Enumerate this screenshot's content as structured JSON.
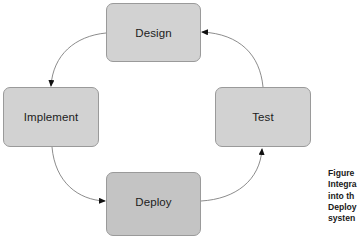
{
  "diagram": {
    "type": "cycle",
    "nodes": [
      {
        "id": "design",
        "label": "Design"
      },
      {
        "id": "implement",
        "label": "Implement"
      },
      {
        "id": "deploy",
        "label": "Deploy"
      },
      {
        "id": "test",
        "label": "Test"
      }
    ],
    "edges": [
      {
        "from": "design",
        "to": "implement"
      },
      {
        "from": "implement",
        "to": "deploy"
      },
      {
        "from": "deploy",
        "to": "test"
      },
      {
        "from": "test",
        "to": "design"
      }
    ],
    "colors": {
      "node_fill": "#d2d2d2",
      "node_fill_dark": "#c4c4c4",
      "node_border": "#9a9a9a",
      "edge": "#6e6e6e",
      "arrowhead": "#111111"
    }
  },
  "caption": {
    "lines": [
      "Figure",
      "Integra",
      "into th",
      "Deploy",
      "systen"
    ]
  }
}
